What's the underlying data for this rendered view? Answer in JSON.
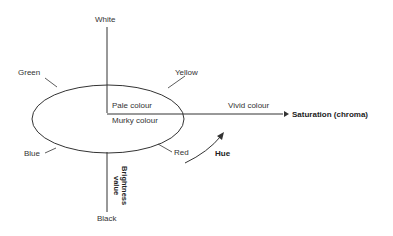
{
  "diagram": {
    "type": "colour-solid-diagram",
    "labels": {
      "top": "White",
      "bottom": "Black",
      "hue_green": "Green",
      "hue_yellow": "Yellow",
      "hue_blue": "Blue",
      "hue_red": "Red",
      "pale": "Pale colour",
      "murky": "Murky colour",
      "vivid": "Vivid colour",
      "saturation_axis": "Saturation (chroma)",
      "hue_arrow": "Hue",
      "brightness_line1": "Brightness",
      "brightness_line2": "value"
    },
    "colors": {
      "line": "#333333",
      "text": "#2a2a2a",
      "background": "#ffffff"
    }
  }
}
